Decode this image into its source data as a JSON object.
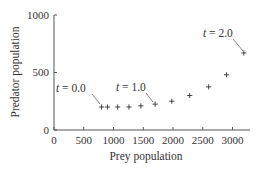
{
  "chart_data": {
    "type": "scatter",
    "title": "",
    "xlabel": "Prey population",
    "ylabel": "Predator population",
    "xlim": [
      0,
      3200
    ],
    "ylim": [
      0,
      1000
    ],
    "x_ticks": [
      0,
      500,
      1000,
      1500,
      2000,
      2500,
      3000
    ],
    "x_tick_labels": [
      "0",
      "500",
      "1000",
      "1500",
      "2000",
      "2500",
      "3000"
    ],
    "y_ticks": [
      0,
      500,
      1000
    ],
    "y_tick_labels": [
      "0",
      "500",
      "1000"
    ],
    "grid": false,
    "legend": null,
    "marker": "+",
    "series": [
      {
        "name": "Predator vs prey trajectory",
        "x": [
          800,
          900,
          1070,
          1260,
          1460,
          1700,
          1980,
          2280,
          2600,
          2900,
          3190
        ],
        "y": [
          200,
          200,
          200,
          200,
          210,
          225,
          250,
          300,
          375,
          480,
          670
        ]
      }
    ],
    "annotations": [
      {
        "text": "t = 0.0",
        "t_var": "t",
        "t_value": "0.0",
        "point_index": 0
      },
      {
        "text": "t = 1.0",
        "t_var": "t",
        "t_value": "1.0",
        "point_index": 5
      },
      {
        "text": "t = 2.0",
        "t_var": "t",
        "t_value": "2.0",
        "point_index": 10
      }
    ]
  },
  "labels": {
    "xlabel": "Prey population",
    "ylabel": "Predator population",
    "x_ticks": [
      "0",
      "500",
      "1000",
      "1500",
      "2000",
      "2500",
      "3000"
    ],
    "y_ticks": [
      "0",
      "500",
      "1000"
    ],
    "annot0_eq": " = 0.0",
    "annot1_eq": " = 1.0",
    "annot2_eq": " = 2.0",
    "t_symbol": "t"
  }
}
